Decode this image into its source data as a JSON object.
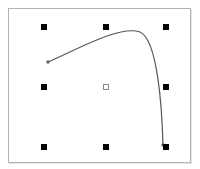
{
  "canvas": {
    "width": 200,
    "height": 169,
    "background": "#ffffff"
  },
  "selection_box": {
    "border_color": "#b4b4b4",
    "handle_color": "#000000",
    "handles": [
      {
        "name": "top-left",
        "x": 44,
        "y": 27
      },
      {
        "name": "top-center",
        "x": 106,
        "y": 27
      },
      {
        "name": "top-right",
        "x": 166,
        "y": 27
      },
      {
        "name": "middle-left",
        "x": 44,
        "y": 87
      },
      {
        "name": "middle-right",
        "x": 166,
        "y": 87
      },
      {
        "name": "bottom-left",
        "x": 44,
        "y": 147
      },
      {
        "name": "bottom-center",
        "x": 106,
        "y": 147
      },
      {
        "name": "bottom-right",
        "x": 166,
        "y": 147
      }
    ],
    "center": {
      "x": 106,
      "y": 87,
      "icon": "center-x-marker"
    }
  },
  "curve": {
    "stroke": "#555555",
    "start": {
      "x": 48,
      "y": 62
    },
    "end": {
      "x": 163,
      "y": 145
    },
    "path": "M48 62 C 80 48, 120 25, 140 32 C 158 40, 162 110, 163 145"
  }
}
